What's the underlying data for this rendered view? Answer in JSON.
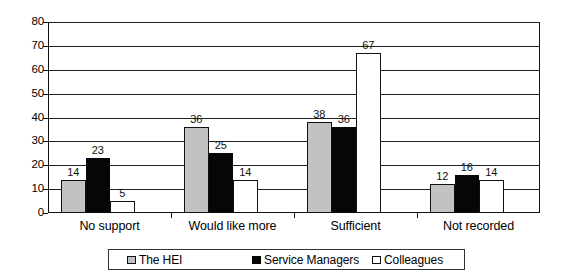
{
  "chart_data": {
    "type": "bar",
    "title": "",
    "subtitle": "",
    "xlabel": "",
    "ylabel": "",
    "ylim": [
      0,
      80
    ],
    "ytick_step": 10,
    "yticks": [
      "0",
      "10",
      "20",
      "30",
      "40",
      "50",
      "60",
      "70",
      "80"
    ],
    "grid": true,
    "legend_position": "bottom",
    "categories": [
      "No support",
      "Would like more",
      "Sufficient",
      "Not recorded"
    ],
    "series": [
      {
        "name": "The HEI",
        "color": "#c2c2c2",
        "values": [
          14,
          36,
          38,
          12
        ],
        "labels": [
          "14",
          "36",
          "38",
          "12"
        ]
      },
      {
        "name": "Service Managers",
        "color": "#060606",
        "values": [
          23,
          25,
          36,
          16
        ],
        "labels": [
          "23",
          "25",
          "36",
          "16"
        ]
      },
      {
        "name": "Colleagues",
        "color": "#ffffff",
        "values": [
          5,
          14,
          67,
          14
        ],
        "labels": [
          "5",
          "14",
          "67",
          "14"
        ]
      }
    ]
  },
  "legend": {
    "items": [
      {
        "label": "The HEI",
        "swatch": "gray-swatch-icon"
      },
      {
        "label": "Service Managers",
        "swatch": "black-swatch-icon"
      },
      {
        "label": "Colleagues",
        "swatch": "white-swatch-icon"
      }
    ]
  }
}
